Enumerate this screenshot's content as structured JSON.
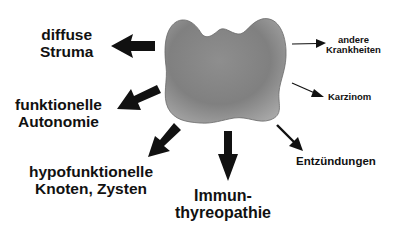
{
  "diagram": {
    "center": {
      "name": "thyroid-gland",
      "fill_light": "#b4b4b4",
      "fill_dark": "#7a7a7a"
    },
    "labels": {
      "diffuse_struma": [
        "diffuse",
        "Struma"
      ],
      "funktionelle_autonomie": [
        "funktionelle",
        "Autonomie"
      ],
      "hypofunktionelle_knoten": [
        "hypofunktionelle",
        "Knoten, Zysten"
      ],
      "immunthyreopathie": [
        "Immun-",
        "thyreopathie"
      ],
      "entzuendungen": [
        "Entzündungen"
      ],
      "andere_krankheiten": [
        "andere",
        "Krankheiten"
      ],
      "karzinom": [
        "Karzinom"
      ]
    },
    "arrow_color": "#111111"
  }
}
